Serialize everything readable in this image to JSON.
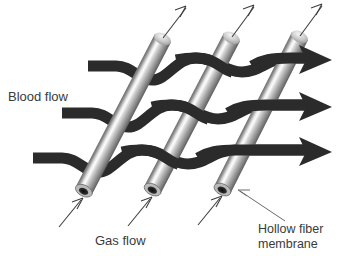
{
  "figure": {
    "background_color": "#ffffff",
    "label_color": "#3a3a3a",
    "ribbon_color": "#2b2b2b",
    "fiber_dark": "#5a5a5a",
    "fiber_mid": "#9a9a9a",
    "fiber_light": "#f2f2f2",
    "fiber_bore_color": "#1a1a1a",
    "leader_color": "#4a4a4a"
  },
  "labels": {
    "blood_flow": "Blood flow",
    "gas_flow": "Gas flow",
    "hollow_fiber_line1": "Hollow fiber",
    "hollow_fiber_line2": "membrane"
  },
  "fibers": [
    {
      "name": "fiber-1",
      "bottom_x": 83,
      "bottom_y": 192,
      "top_x": 163,
      "top_y": 38
    },
    {
      "name": "fiber-2",
      "bottom_x": 152,
      "bottom_y": 191,
      "top_x": 232,
      "top_y": 37
    },
    {
      "name": "fiber-3",
      "bottom_x": 222,
      "bottom_y": 190,
      "top_x": 300,
      "top_y": 36
    }
  ],
  "blood_streams": [
    {
      "name": "blood-stream-top",
      "start_x": 88,
      "start_y": 66,
      "end_x": 330,
      "end_y": 68
    },
    {
      "name": "blood-stream-middle",
      "start_x": 62,
      "start_y": 113,
      "end_x": 330,
      "end_y": 114
    },
    {
      "name": "blood-stream-bottom",
      "start_x": 33,
      "start_y": 158,
      "end_x": 330,
      "end_y": 158
    }
  ],
  "gas_out_arrows": [
    {
      "name": "gas-out-arrow-1",
      "tail_x": 163,
      "tail_y": 38,
      "head_x": 186,
      "head_y": 6
    },
    {
      "name": "gas-out-arrow-2",
      "tail_x": 232,
      "tail_y": 37,
      "head_x": 254,
      "head_y": 5
    },
    {
      "name": "gas-out-arrow-3",
      "tail_x": 300,
      "tail_y": 36,
      "head_x": 322,
      "head_y": 4
    }
  ],
  "gas_in_arrows": [
    {
      "name": "gas-in-arrow-1",
      "tail_x": 59,
      "tail_y": 227,
      "head_x": 82,
      "head_y": 198
    },
    {
      "name": "gas-in-arrow-2",
      "tail_x": 128,
      "tail_y": 226,
      "head_x": 151,
      "head_y": 197
    },
    {
      "name": "gas-in-arrow-3",
      "tail_x": 198,
      "tail_y": 225,
      "head_x": 221,
      "head_y": 196
    }
  ],
  "leaders": [
    {
      "name": "hollow-fiber-leader",
      "tail_x": 285,
      "tail_y": 221,
      "head_x": 238,
      "head_y": 190
    }
  ],
  "label_positions": {
    "blood_flow": {
      "x": 8,
      "y": 101
    },
    "gas_flow": {
      "x": 95,
      "y": 245
    },
    "hollow_fiber": {
      "x": 258,
      "y": 233
    }
  }
}
